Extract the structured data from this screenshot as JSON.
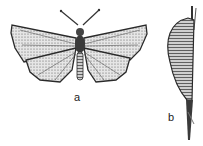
{
  "figure": {
    "panels": [
      {
        "id": "a",
        "label": "a",
        "subject": "adult butterfly, dorsal view"
      },
      {
        "id": "b",
        "label": "b",
        "subject": "pupa (chrysalis) on stem"
      }
    ],
    "colors": {
      "ink": "#2a2a2a",
      "background": "#ffffff",
      "shading": "#8a8a8a"
    }
  }
}
